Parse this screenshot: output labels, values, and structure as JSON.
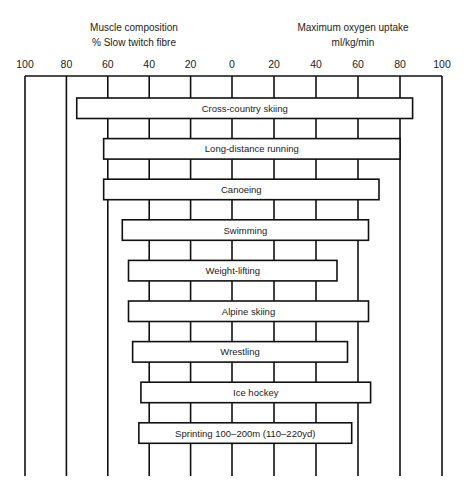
{
  "chart_data": {
    "type": "bar",
    "orientation": "horizontal-diverging",
    "left_axis": {
      "title_line1": "Muscle composition",
      "title_line2": "% Slow twitch fibre",
      "range": [
        100,
        0
      ],
      "ticks": [
        "100",
        "80",
        "60",
        "40",
        "20",
        "0"
      ]
    },
    "right_axis": {
      "title_line1": "Maximum oxygen uptake",
      "title_line2": "ml/kg/min",
      "range": [
        0,
        100
      ],
      "ticks": [
        "20",
        "40",
        "60",
        "80",
        "100"
      ]
    },
    "grid": true,
    "categories": [
      "Cross-country skiing",
      "Long-distance running",
      "Canoeing",
      "Swimming",
      "Weight-lifting",
      "Alpine skiing",
      "Wrestling",
      "Ice hockey",
      "Sprinting 100–200m (110–220yd)"
    ],
    "series": [
      {
        "name": "% Slow twitch fibre",
        "side": "left",
        "values": [
          75,
          62,
          62,
          53,
          50,
          50,
          48,
          44,
          45
        ]
      },
      {
        "name": "Maximum oxygen uptake (ml/kg/min)",
        "side": "right",
        "values": [
          86,
          80,
          70,
          65,
          50,
          65,
          55,
          66,
          57
        ]
      }
    ]
  }
}
